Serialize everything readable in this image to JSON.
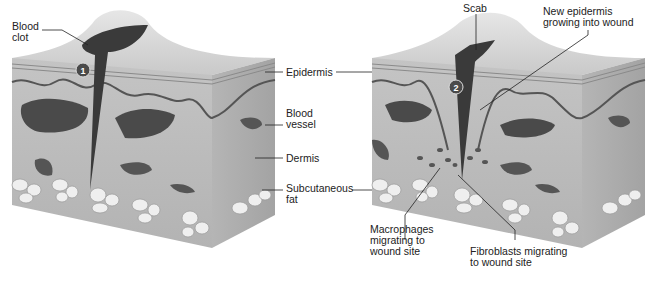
{
  "figure": {
    "panels": [
      {
        "step": "1",
        "labels": {
          "blood_clot": "Blood\nclot"
        }
      },
      {
        "step": "2",
        "labels": {
          "scab": "Scab",
          "new_epidermis": "New epidermis\ngrowing into wound",
          "macrophages": "Macrophages\nmigrating to\nwound site",
          "fibroblasts": "Fibroblasts migrating\nto wound site"
        }
      }
    ],
    "shared_labels": {
      "epidermis": "Epidermis",
      "blood_vessel": "Blood\nvessel",
      "dermis": "Dermis",
      "subcutaneous_fat": "Subcutaneous\nfat"
    },
    "colors": {
      "skin_top": "#d9d9d9",
      "skin_front": "#bdbdbd",
      "skin_side": "#a9a9a9",
      "wound": "#3a3a3a",
      "vessel": "#4a4a4a",
      "fat": "#efefef"
    }
  }
}
